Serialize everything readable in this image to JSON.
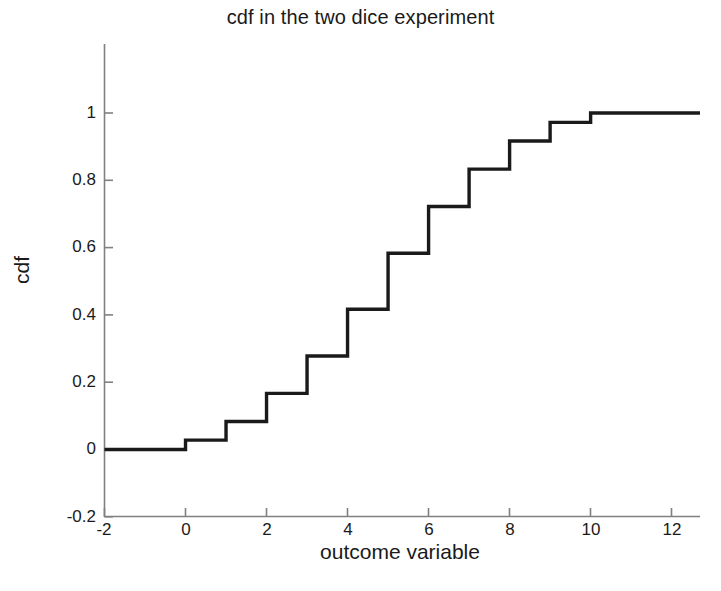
{
  "chart_data": {
    "type": "line",
    "subtype": "step",
    "title": "cdf in the two dice experiment",
    "xlabel": "outcome variable",
    "ylabel": "cdf",
    "xlim": [
      -2,
      12.7
    ],
    "ylim": [
      -0.2,
      1.12
    ],
    "grid": false,
    "legend": null,
    "xticks": [
      -2,
      0,
      2,
      4,
      6,
      8,
      10,
      12
    ],
    "xticklabels": [
      "-2",
      "0",
      "2",
      "4",
      "6",
      "8",
      "10",
      "12"
    ],
    "yticks": [
      -0.2,
      0,
      0.2,
      0.4,
      0.6,
      0.8,
      1
    ],
    "yticklabels": [
      "-0.2",
      "0",
      "0.2",
      "0.4",
      "0.6",
      "0.8",
      "1"
    ],
    "series": [
      {
        "name": "cdf",
        "color": "#1a1a1a",
        "linewidth": 3.4,
        "x": [
          -2,
          0,
          1,
          2,
          3,
          4,
          5,
          6,
          7,
          8,
          9,
          10,
          12.7
        ],
        "y": [
          0,
          0.0278,
          0.0833,
          0.1667,
          0.2778,
          0.4167,
          0.5833,
          0.7222,
          0.8333,
          0.9167,
          0.9722,
          1.0,
          1.0
        ]
      }
    ],
    "step_values": [
      {
        "outcome": 0,
        "cdf": 0.0278,
        "fraction": "1/36"
      },
      {
        "outcome": 1,
        "cdf": 0.0833,
        "fraction": "3/36"
      },
      {
        "outcome": 2,
        "cdf": 0.1667,
        "fraction": "6/36"
      },
      {
        "outcome": 3,
        "cdf": 0.2778,
        "fraction": "10/36"
      },
      {
        "outcome": 4,
        "cdf": 0.4167,
        "fraction": "15/36"
      },
      {
        "outcome": 5,
        "cdf": 0.5833,
        "fraction": "21/36"
      },
      {
        "outcome": 6,
        "cdf": 0.7222,
        "fraction": "26/36"
      },
      {
        "outcome": 7,
        "cdf": 0.8333,
        "fraction": "30/36"
      },
      {
        "outcome": 8,
        "cdf": 0.9167,
        "fraction": "33/36"
      },
      {
        "outcome": 9,
        "cdf": 0.9722,
        "fraction": "35/36"
      },
      {
        "outcome": 10,
        "cdf": 1.0,
        "fraction": "36/36"
      }
    ],
    "axis_color": "#808080",
    "background": "#ffffff"
  }
}
